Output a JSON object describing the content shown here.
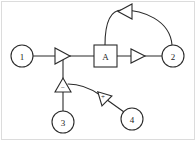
{
  "diagram": {
    "background_color": "#ffffff",
    "stroke_color": "#2b2b2b",
    "frame_color": "#dcdcdc",
    "nodes": [
      {
        "id": "n1",
        "label": "1",
        "shape": "circle",
        "cx": 22,
        "cy": 56,
        "r": 11
      },
      {
        "id": "n2",
        "label": "2",
        "shape": "circle",
        "cx": 173,
        "cy": 56,
        "r": 11
      },
      {
        "id": "n3",
        "label": "3",
        "shape": "circle",
        "cx": 63,
        "cy": 122,
        "r": 11
      },
      {
        "id": "n4",
        "label": "4",
        "shape": "circle",
        "cx": 132,
        "cy": 119,
        "r": 11
      }
    ],
    "blocks": [
      {
        "id": "bA",
        "label": "A",
        "shape": "rect",
        "x": 94,
        "y": 45,
        "w": 23,
        "h": 22
      }
    ],
    "arrowheads": [
      {
        "id": "a1",
        "on_edge": "e_1_to_junction",
        "direction": "right",
        "sign": ""
      },
      {
        "id": "a2",
        "on_edge": "e_A_to_2",
        "direction": "right",
        "sign": ""
      },
      {
        "id": "a3",
        "on_edge": "e_2_to_A_arc",
        "direction": "left",
        "sign": ""
      },
      {
        "id": "a4",
        "on_edge": "e_3_to_junction",
        "direction": "up",
        "sign": "−"
      },
      {
        "id": "a5",
        "on_edge": "e_4_to_curve",
        "direction": "upleft",
        "sign": "+"
      }
    ],
    "edges": [
      {
        "id": "e_1_to_junction",
        "from": "n1",
        "to": "junction",
        "style": "straight"
      },
      {
        "id": "e_junction_to_A",
        "from": "junction",
        "to": "bA",
        "style": "straight"
      },
      {
        "id": "e_A_to_2",
        "from": "bA",
        "to": "n2",
        "style": "straight"
      },
      {
        "id": "e_2_to_A_arc",
        "from": "n2",
        "to": "bA",
        "style": "arc-feedback"
      },
      {
        "id": "e_3_to_junction",
        "from": "n3",
        "to": "junction",
        "style": "straight"
      },
      {
        "id": "e_4_to_curve",
        "from": "n4",
        "to": "junction",
        "style": "curve"
      }
    ],
    "junction": {
      "x": 70,
      "y": 56
    }
  }
}
